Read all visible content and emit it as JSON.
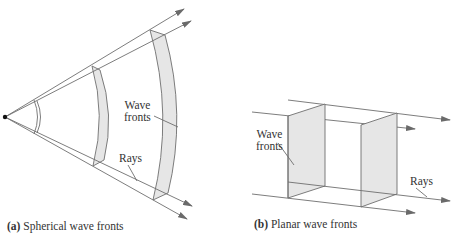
{
  "figure": {
    "panel_a": {
      "caption_tag": "(a)",
      "caption_text": "Spherical wave fronts",
      "label_wave_fronts": [
        "Wave",
        "fronts"
      ],
      "label_rays": "Rays"
    },
    "panel_b": {
      "caption_tag": "(b)",
      "caption_text": "Planar wave fronts",
      "label_wave_fronts": [
        "Wave",
        "fronts"
      ],
      "label_rays": "Rays"
    },
    "colors": {
      "line": "#6e6e6e",
      "fill": "#e6e6e6",
      "arrow": "#6a6a6a",
      "text": "#333333"
    }
  }
}
